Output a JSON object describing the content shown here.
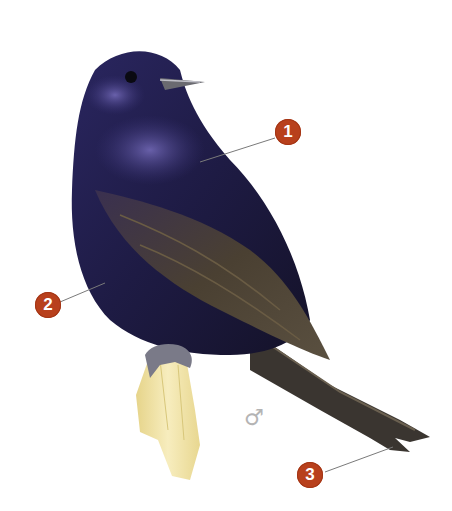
{
  "colors": {
    "marker_fill": "#b8401c",
    "marker_text": "#ffffff",
    "plumage_dark": "#1c1a3a",
    "plumage_sheen": "#4a3f8a",
    "wing_brown": "#4a4030",
    "perch": "#f0e3a6",
    "feet": "#7a7a88",
    "leader_line": "#7a7a7a"
  },
  "callouts": [
    {
      "number": "1",
      "target": "back / mantle"
    },
    {
      "number": "2",
      "target": "belly / flank"
    },
    {
      "number": "3",
      "target": "tail tip"
    }
  ],
  "sex_symbol": "♂"
}
